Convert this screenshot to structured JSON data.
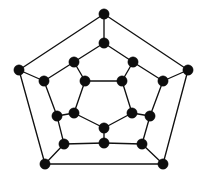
{
  "figure": {
    "caption": "",
    "background_color": "#ffffff",
    "width": 206,
    "height": 180
  },
  "diagram": {
    "type": "undirected-graph",
    "name": "dodecahedral-graph",
    "vertex_count": 20,
    "edge_count": 30,
    "degree": 3,
    "vertex_color": "#0d0d0d",
    "edge_color": "#111111",
    "vertex_radius": 5.2,
    "edge_width": 1.35,
    "labels_visible": false,
    "rings": [
      {
        "name": "outer-pentagon",
        "ids": [
          0,
          1,
          2,
          3,
          4
        ]
      },
      {
        "name": "ring-two",
        "ids": [
          5,
          6,
          7,
          8,
          9
        ]
      },
      {
        "name": "ring-three",
        "ids": [
          10,
          11,
          12,
          13,
          14
        ]
      },
      {
        "name": "inner-pentagon",
        "ids": [
          15,
          16,
          17,
          18,
          19
        ]
      }
    ],
    "vertices": [
      {
        "id": 0,
        "name": "outer-top",
        "x": 104,
        "y": 14
      },
      {
        "id": 1,
        "name": "outer-left",
        "x": 19,
        "y": 70
      },
      {
        "id": 2,
        "name": "outer-right",
        "x": 188,
        "y": 70
      },
      {
        "id": 3,
        "name": "outer-bottom-left",
        "x": 45,
        "y": 164
      },
      {
        "id": 4,
        "name": "outer-bottom-right",
        "x": 163,
        "y": 164
      },
      {
        "id": 5,
        "name": "ring2-top",
        "x": 104,
        "y": 43
      },
      {
        "id": 6,
        "name": "ring2-left",
        "x": 44,
        "y": 81
      },
      {
        "id": 7,
        "name": "ring2-right",
        "x": 163,
        "y": 81
      },
      {
        "id": 8,
        "name": "ring2-bottom-left",
        "x": 64,
        "y": 144
      },
      {
        "id": 9,
        "name": "ring2-bottom-right",
        "x": 142,
        "y": 144
      },
      {
        "id": 10,
        "name": "ring3-upper-left",
        "x": 74,
        "y": 62
      },
      {
        "id": 11,
        "name": "ring3-upper-right",
        "x": 133,
        "y": 62
      },
      {
        "id": 12,
        "name": "ring3-left",
        "x": 57,
        "y": 116
      },
      {
        "id": 13,
        "name": "ring3-right",
        "x": 150,
        "y": 116
      },
      {
        "id": 14,
        "name": "ring3-bottom",
        "x": 104,
        "y": 143
      },
      {
        "id": 15,
        "name": "inner-upper-left",
        "x": 85,
        "y": 81
      },
      {
        "id": 16,
        "name": "inner-upper-right",
        "x": 122,
        "y": 81
      },
      {
        "id": 17,
        "name": "inner-left",
        "x": 74,
        "y": 113
      },
      {
        "id": 18,
        "name": "inner-right",
        "x": 132,
        "y": 113
      },
      {
        "id": 19,
        "name": "inner-bottom",
        "x": 104,
        "y": 128
      }
    ],
    "edges": [
      {
        "from": 0,
        "to": 1,
        "group": "outer-pentagon"
      },
      {
        "from": 0,
        "to": 2,
        "group": "outer-pentagon"
      },
      {
        "from": 1,
        "to": 3,
        "group": "outer-pentagon"
      },
      {
        "from": 2,
        "to": 4,
        "group": "outer-pentagon"
      },
      {
        "from": 3,
        "to": 4,
        "group": "outer-pentagon"
      },
      {
        "from": 0,
        "to": 5,
        "group": "outer-to-ring2-spoke"
      },
      {
        "from": 1,
        "to": 6,
        "group": "outer-to-ring2-spoke"
      },
      {
        "from": 2,
        "to": 7,
        "group": "outer-to-ring2-spoke"
      },
      {
        "from": 3,
        "to": 8,
        "group": "outer-to-ring2-spoke"
      },
      {
        "from": 4,
        "to": 9,
        "group": "outer-to-ring2-spoke"
      },
      {
        "from": 5,
        "to": 10,
        "group": "ring2-to-ring3"
      },
      {
        "from": 5,
        "to": 11,
        "group": "ring2-to-ring3"
      },
      {
        "from": 6,
        "to": 10,
        "group": "ring2-to-ring3"
      },
      {
        "from": 6,
        "to": 12,
        "group": "ring2-to-ring3"
      },
      {
        "from": 7,
        "to": 11,
        "group": "ring2-to-ring3"
      },
      {
        "from": 7,
        "to": 13,
        "group": "ring2-to-ring3"
      },
      {
        "from": 8,
        "to": 12,
        "group": "ring2-to-ring3"
      },
      {
        "from": 8,
        "to": 14,
        "group": "ring2-to-ring3"
      },
      {
        "from": 9,
        "to": 13,
        "group": "ring2-to-ring3"
      },
      {
        "from": 9,
        "to": 14,
        "group": "ring2-to-ring3"
      },
      {
        "from": 10,
        "to": 15,
        "group": "ring3-to-inner-spoke"
      },
      {
        "from": 11,
        "to": 16,
        "group": "ring3-to-inner-spoke"
      },
      {
        "from": 12,
        "to": 17,
        "group": "ring3-to-inner-spoke"
      },
      {
        "from": 13,
        "to": 18,
        "group": "ring3-to-inner-spoke"
      },
      {
        "from": 14,
        "to": 19,
        "group": "ring3-to-inner-spoke"
      },
      {
        "from": 15,
        "to": 16,
        "group": "inner-pentagon"
      },
      {
        "from": 15,
        "to": 17,
        "group": "inner-pentagon"
      },
      {
        "from": 16,
        "to": 18,
        "group": "inner-pentagon"
      },
      {
        "from": 17,
        "to": 19,
        "group": "inner-pentagon"
      },
      {
        "from": 18,
        "to": 19,
        "group": "inner-pentagon"
      }
    ]
  }
}
